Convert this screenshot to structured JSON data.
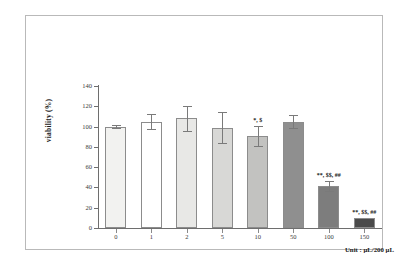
{
  "chart_data": {
    "type": "bar",
    "title": "",
    "xlabel": "",
    "ylabel": "viability (%)",
    "categories": [
      "0",
      "1",
      "2",
      "5",
      "10",
      "50",
      "100",
      "150"
    ],
    "values": [
      100,
      105,
      108,
      99,
      91,
      105,
      41,
      10
    ],
    "errors": [
      1.5,
      7,
      12,
      15,
      10,
      6,
      5,
      0
    ],
    "ylim": [
      0,
      140
    ],
    "yticks": [
      0,
      20,
      40,
      60,
      80,
      100,
      120,
      140
    ],
    "ytick_labels": [
      "0",
      "20",
      "40",
      "60",
      "80",
      "100",
      "120",
      "140"
    ],
    "grid": false,
    "legend": false,
    "bar_colors": [
      "#f2f2f0",
      "#ffffff",
      "#e8e8e6",
      "#d8d8d6",
      "#c2c2c0",
      "#8f8f8f",
      "#7d7d7d",
      "#4a4a4a"
    ],
    "annotations": [
      "",
      "",
      "",
      "",
      "*, $",
      "",
      "**, $$, ##",
      "**, $$, ##"
    ],
    "unit_note": "Unit : μL/200 μL"
  },
  "axis": {
    "y_label": "viability (%)"
  },
  "footer": {
    "unit": "Unit : μL/200 μL"
  }
}
